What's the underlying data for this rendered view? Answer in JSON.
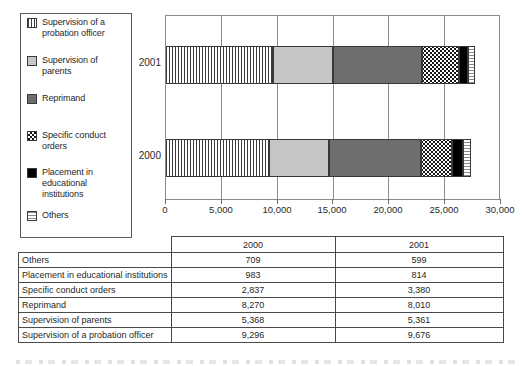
{
  "chart_data": {
    "type": "bar",
    "orientation": "horizontal-stacked",
    "title": "",
    "xlabel": "",
    "ylabel": "",
    "xlim": [
      0,
      30000
    ],
    "grid": "vertical",
    "tick_labels": [
      "0",
      "5,000",
      "10,000",
      "15,000",
      "20,000",
      "25,000",
      "30,000"
    ],
    "series_names": [
      "Supervision of a probation officer",
      "Supervision of parents",
      "Reprimand",
      "Specific conduct orders",
      "Placement in educational institutions",
      "Others"
    ],
    "slugs": [
      "probation-officer",
      "parents",
      "reprimand",
      "conduct-orders",
      "placement",
      "others"
    ],
    "patterns": [
      "vstripes",
      "lightgray",
      "darkgray",
      "checker",
      "black",
      "hstripes"
    ],
    "bars": [
      {
        "year": "2001",
        "values": [
          9676,
          5361,
          8010,
          3380,
          814,
          599
        ]
      },
      {
        "year": "2000",
        "values": [
          9296,
          5368,
          8270,
          2837,
          983,
          709
        ]
      }
    ]
  },
  "legend": {
    "items": [
      {
        "label": "Supervision of a probation officer",
        "pattern": "vstripes"
      },
      {
        "label": "Supervision of parents",
        "pattern": "lightgray"
      },
      {
        "label": "Reprimand",
        "pattern": "darkgray"
      },
      {
        "label": "Specific conduct orders",
        "pattern": "checker"
      },
      {
        "label": "Placement in educational institutions",
        "pattern": "black"
      },
      {
        "label": "Others",
        "pattern": "hstripes"
      }
    ]
  },
  "axis": {
    "categories": [
      "2001",
      "2000"
    ]
  },
  "table": {
    "header": [
      "",
      "2000",
      "2001"
    ],
    "rows": [
      {
        "label": "Others",
        "y2000": "709",
        "y2001": "599"
      },
      {
        "label": "Placement in educational institutions",
        "y2000": "983",
        "y2001": "814"
      },
      {
        "label": "Specific conduct orders",
        "y2000": "2,837",
        "y2001": "3,380"
      },
      {
        "label": "Reprimand",
        "y2000": "8,270",
        "y2001": "8,010"
      },
      {
        "label": "Supervision of parents",
        "y2000": "5,368",
        "y2001": "5,361"
      },
      {
        "label": "Supervision of a probation officer",
        "y2000": "9,296",
        "y2001": "9,676"
      }
    ]
  },
  "colors": {
    "segment_light_gray": "#c6c6c6",
    "segment_dark_gray": "#6e6e6e",
    "segment_black": "#000000",
    "stripe_line": "#3c3c3c",
    "grid_line": "#8c8c8c",
    "border": "#4a4a4a",
    "background": "#ffffff"
  }
}
